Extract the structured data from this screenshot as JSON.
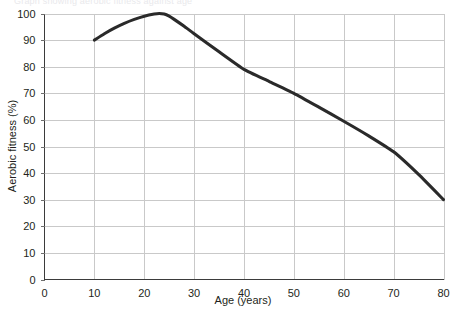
{
  "figure": {
    "cropped_header_text": "Graph showing aerobic fitness against age",
    "background_color": "#ffffff"
  },
  "chart_data": {
    "type": "line",
    "title": "",
    "xlabel": "Age (years)",
    "ylabel": "Aerobic fitness (%)",
    "xlim": [
      0,
      80
    ],
    "ylim": [
      0,
      100
    ],
    "xticks": [
      0,
      10,
      20,
      30,
      40,
      50,
      60,
      70,
      80
    ],
    "xtick_labels": [
      "0",
      "10",
      "20",
      "30",
      "40",
      "50",
      "60",
      "70",
      "80"
    ],
    "yticks": [
      0,
      10,
      20,
      30,
      40,
      50,
      60,
      70,
      80,
      90,
      100
    ],
    "ytick_labels": [
      "0",
      "10",
      "20",
      "30",
      "40",
      "50",
      "60",
      "70",
      "80",
      "90",
      "100"
    ],
    "grid": true,
    "grid_color": "#c9c9c9",
    "axis_color": "#3b3b3b",
    "legend": null,
    "legend_position": "none",
    "series": [
      {
        "name": "Aerobic fitness",
        "color": "#2a2a2a",
        "line_width": 3,
        "x": [
          10,
          12,
          14,
          16,
          18,
          20,
          22,
          23,
          24,
          25,
          26,
          28,
          30,
          35,
          40,
          45,
          50,
          55,
          60,
          65,
          70,
          75,
          80
        ],
        "values": [
          90,
          92.4,
          94.5,
          96.3,
          97.8,
          99,
          99.8,
          100,
          99.8,
          99,
          97.8,
          95.2,
          92.4,
          85.6,
          79,
          74.5,
          70,
          64.8,
          59.5,
          54,
          48,
          39.5,
          30
        ]
      }
    ]
  },
  "axes_labels": {
    "x_title": "Age (years)",
    "y_title": "Aerobic fitness (%)"
  }
}
